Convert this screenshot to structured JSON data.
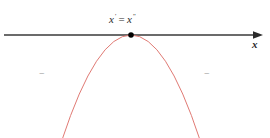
{
  "figure": {
    "title": "",
    "background_color": "#ffffff",
    "width": 270,
    "height": 138
  },
  "axis": {
    "name": "x-axis",
    "label": "x",
    "color": "#3a3a3a",
    "arrow": "right-arrowhead",
    "y_position": 35,
    "x_start": 4,
    "x_end": 262
  },
  "vertex": {
    "marker": "filled-dot",
    "color": "#000000",
    "x": 131,
    "y": 35,
    "label_left": "x",
    "label_left_sup": "'",
    "label_equals": "=",
    "label_right": "x",
    "label_right_sup": "\"",
    "label_full": "x' = x\""
  },
  "curve": {
    "name": "downward-parabola",
    "color": "#e07a74",
    "stroke_width": 1,
    "vertex_x": 131,
    "vertex_y": 35,
    "left_end_x": 62,
    "right_end_x": 200,
    "bottom_y": 138
  },
  "sign_marks": {
    "left": "−",
    "right": "−",
    "color": "#8f8f8f"
  },
  "chart_data": {
    "type": "line",
    "title": "",
    "xlabel": "x",
    "ylabel": "",
    "series": [
      {
        "name": "downward-parabola",
        "color": "#e07a74",
        "x": [
          62,
          75,
          90,
          105,
          118,
          131,
          144,
          157,
          172,
          187,
          200
        ],
        "y": [
          138,
          110,
          78,
          54,
          40,
          35,
          40,
          54,
          78,
          110,
          138
        ]
      }
    ],
    "annotations": [
      {
        "text": "x' = x\"",
        "x": 131,
        "y": 20
      },
      {
        "text": "−",
        "x": 43,
        "y": 75
      },
      {
        "text": "−",
        "x": 208,
        "y": 75
      }
    ],
    "points": [
      {
        "name": "vertex",
        "x": 131,
        "y": 35,
        "marker": "filled-dot"
      }
    ],
    "grid": false,
    "legend": "none"
  }
}
